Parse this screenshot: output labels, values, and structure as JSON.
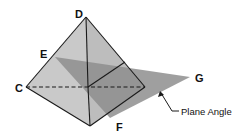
{
  "diagram": {
    "vertices": {
      "D": {
        "label": "D",
        "x": 86,
        "y": 17
      },
      "C": {
        "label": "C",
        "x": 26,
        "y": 87
      },
      "bottom": {
        "x": 90,
        "y": 126
      },
      "right": {
        "x": 145,
        "y": 87
      },
      "center": {
        "x": 88,
        "y": 87
      },
      "E": {
        "label": "E"
      },
      "F": {
        "label": "F"
      },
      "G": {
        "label": "G",
        "x": 190,
        "y": 77
      }
    },
    "labels": {
      "D": "D",
      "E": "E",
      "C": "C",
      "F": "F",
      "G": "G"
    },
    "callout": {
      "text": "Plane Angle"
    },
    "colors": {
      "left_face": "#c9c9c9",
      "right_face": "#b7b7b7",
      "plane": "#8e8e8e",
      "plane_inside": "#8a8a8a",
      "edges": "#1a1a1a"
    }
  }
}
